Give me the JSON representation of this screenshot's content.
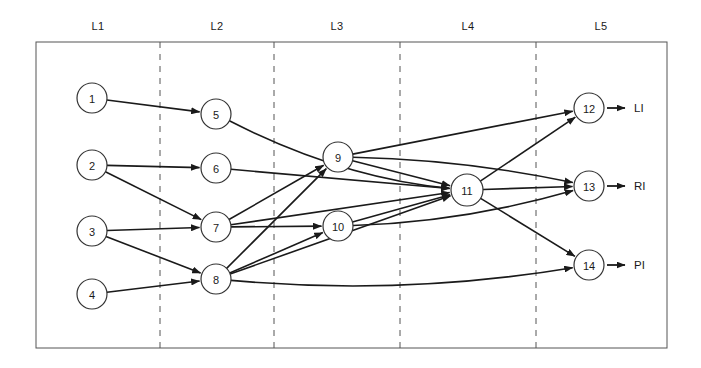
{
  "diagram": {
    "type": "layered-network-graph",
    "title": "",
    "background_color": "#ffffff",
    "stroke_color": "#1a1a1a",
    "node_fill": "#ffffff",
    "frame": {
      "x": 36,
      "y": 42,
      "width": 631,
      "height": 306
    },
    "layer_labels": [
      {
        "id": "L1",
        "text": "L1",
        "x": 98,
        "y": 27
      },
      {
        "id": "L2",
        "text": "L2",
        "x": 217,
        "y": 27
      },
      {
        "id": "L3",
        "text": "L3",
        "x": 337,
        "y": 27
      },
      {
        "id": "L4",
        "text": "L4",
        "x": 468,
        "y": 27
      },
      {
        "id": "L5",
        "text": "L5",
        "x": 601,
        "y": 27
      }
    ],
    "dividers": [
      {
        "id": "divider-1",
        "x": 160
      },
      {
        "id": "divider-2",
        "x": 274
      },
      {
        "id": "divider-3",
        "x": 400
      },
      {
        "id": "divider-4",
        "x": 536
      }
    ],
    "nodes": [
      {
        "id": "n1",
        "label": "1",
        "layer": "L1",
        "cx": 92,
        "cy": 98,
        "r": 15
      },
      {
        "id": "n2",
        "label": "2",
        "layer": "L1",
        "cx": 92,
        "cy": 165,
        "r": 15
      },
      {
        "id": "n3",
        "label": "3",
        "layer": "L1",
        "cx": 92,
        "cy": 231,
        "r": 15
      },
      {
        "id": "n4",
        "label": "4",
        "layer": "L1",
        "cx": 92,
        "cy": 294,
        "r": 15
      },
      {
        "id": "n5",
        "label": "5",
        "layer": "L2",
        "cx": 216,
        "cy": 114,
        "r": 15
      },
      {
        "id": "n6",
        "label": "6",
        "layer": "L2",
        "cx": 216,
        "cy": 168,
        "r": 15
      },
      {
        "id": "n7",
        "label": "7",
        "layer": "L2",
        "cx": 216,
        "cy": 227,
        "r": 15
      },
      {
        "id": "n8",
        "label": "8",
        "layer": "L2",
        "cx": 216,
        "cy": 279,
        "r": 15
      },
      {
        "id": "n9",
        "label": "9",
        "layer": "L3",
        "cx": 338,
        "cy": 157,
        "r": 15
      },
      {
        "id": "n10",
        "label": "10",
        "layer": "L3",
        "cx": 338,
        "cy": 226,
        "r": 15
      },
      {
        "id": "n11",
        "label": "11",
        "layer": "L4",
        "cx": 467,
        "cy": 190,
        "r": 16
      },
      {
        "id": "n12",
        "label": "12",
        "layer": "L5",
        "cx": 589,
        "cy": 108,
        "r": 15
      },
      {
        "id": "n13",
        "label": "13",
        "layer": "L5",
        "cx": 589,
        "cy": 186,
        "r": 15
      },
      {
        "id": "n14",
        "label": "14",
        "layer": "L5",
        "cx": 589,
        "cy": 265,
        "r": 15
      }
    ],
    "edges": [
      {
        "id": "e1-5",
        "from": "n1",
        "to": "n5",
        "curve": 0
      },
      {
        "id": "e2-6",
        "from": "n2",
        "to": "n6",
        "curve": 0
      },
      {
        "id": "e2-7",
        "from": "n2",
        "to": "n7",
        "curve": 0
      },
      {
        "id": "e3-7",
        "from": "n3",
        "to": "n7",
        "curve": 0
      },
      {
        "id": "e3-8",
        "from": "n3",
        "to": "n8",
        "curve": 0
      },
      {
        "id": "e4-8",
        "from": "n4",
        "to": "n8",
        "curve": 0
      },
      {
        "id": "e5-11",
        "from": "n5",
        "to": "n11",
        "curve": 26
      },
      {
        "id": "e6-11",
        "from": "n6",
        "to": "n11",
        "curve": 0
      },
      {
        "id": "e7-9",
        "from": "n7",
        "to": "n9",
        "curve": 0
      },
      {
        "id": "e7-10",
        "from": "n7",
        "to": "n10",
        "curve": 0
      },
      {
        "id": "e7-11",
        "from": "n7",
        "to": "n11",
        "curve": 0
      },
      {
        "id": "e8-9",
        "from": "n8",
        "to": "n9",
        "curve": 0
      },
      {
        "id": "e8-10",
        "from": "n8",
        "to": "n10",
        "curve": 0
      },
      {
        "id": "e8-11",
        "from": "n8",
        "to": "n11",
        "curve": 0
      },
      {
        "id": "e8-14",
        "from": "n8",
        "to": "n14",
        "curve": 24
      },
      {
        "id": "e9-11",
        "from": "n9",
        "to": "n11",
        "curve": 0
      },
      {
        "id": "e9-12",
        "from": "n9",
        "to": "n12",
        "curve": 0
      },
      {
        "id": "e9-13",
        "from": "n9",
        "to": "n13",
        "curve": -12
      },
      {
        "id": "e10-11",
        "from": "n10",
        "to": "n11",
        "curve": 0
      },
      {
        "id": "e10-13",
        "from": "n10",
        "to": "n13",
        "curve": 16
      },
      {
        "id": "e11-12",
        "from": "n11",
        "to": "n12",
        "curve": 0
      },
      {
        "id": "e11-13",
        "from": "n11",
        "to": "n13",
        "curve": 0
      },
      {
        "id": "e11-14",
        "from": "n11",
        "to": "n14",
        "curve": 0
      }
    ],
    "outputs": [
      {
        "id": "out-li",
        "label": "LI",
        "from": "n12",
        "label_x": 634,
        "label_y": 108,
        "arrow_x1": 607,
        "arrow_x2": 625
      },
      {
        "id": "out-ri",
        "label": "RI",
        "from": "n13",
        "label_x": 634,
        "label_y": 186,
        "arrow_x1": 607,
        "arrow_x2": 625
      },
      {
        "id": "out-pi",
        "label": "PI",
        "from": "n14",
        "label_x": 634,
        "label_y": 265,
        "arrow_x1": 607,
        "arrow_x2": 625
      }
    ]
  }
}
